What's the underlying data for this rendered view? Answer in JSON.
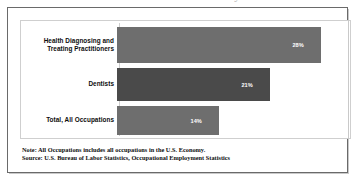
{
  "chart_data": {
    "type": "bar",
    "orientation": "horizontal",
    "title": "",
    "xlabel": "",
    "ylabel": "",
    "categories": [
      "Health Diagnosing and Treating Practitioners",
      "Dentists",
      "Total, All Occupations"
    ],
    "values": [
      28,
      21,
      14
    ],
    "value_labels": [
      "28%",
      "21%",
      "14%"
    ],
    "value_suffix": "%",
    "xlim": [
      0,
      32
    ],
    "grid": false,
    "legend": null,
    "bar_colors": [
      "#6e6e6e",
      "#4a4a4a",
      "#6e6e6e"
    ],
    "value_label_color": "#ffffff",
    "axis_line_color": "#cfcfcf"
  },
  "figure": {
    "frame_color": "#6a6a6a",
    "plot_border_color": "#cfcfcf",
    "background": "#ffffff",
    "title_sliver": "Percent of Workers Paid Hourly Rates"
  },
  "notes": {
    "note_line": "Note: All Occupations includes all occupations in the U.S. Economy.",
    "source_line": "Source: U.S. Bureau of Labor Statistics, Occupational Employment Statistics"
  }
}
